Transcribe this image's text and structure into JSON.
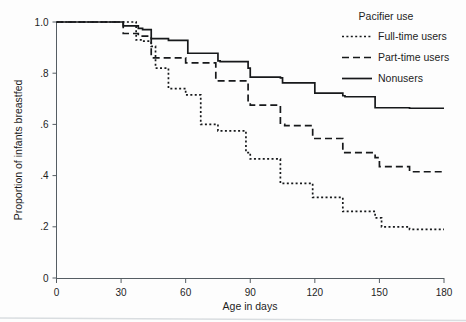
{
  "chart_data": {
    "type": "line",
    "subtype": "kaplan-meier-step",
    "title": "",
    "xlabel": "Age in days",
    "ylabel": "Proportion of infants breastfed",
    "xlim": [
      0,
      180
    ],
    "ylim": [
      0,
      1.0
    ],
    "xticks": [
      0,
      30,
      60,
      90,
      120,
      150,
      180
    ],
    "xtick_labels": [
      "0",
      "30",
      "60",
      "90",
      "120",
      "150",
      "180"
    ],
    "yticks": [
      0,
      0.2,
      0.4,
      0.6,
      0.8,
      1.0
    ],
    "ytick_labels": [
      "0",
      ".2",
      ".4",
      ".6",
      ".8",
      "1.0"
    ],
    "grid": false,
    "legend_position": "top-right",
    "legend_title": "Pacifier use",
    "series": [
      {
        "name": "Full-time users",
        "style": "dotted",
        "color": "#17191b",
        "x": [
          0,
          30,
          37,
          40,
          44,
          45,
          46,
          52,
          60,
          61,
          67,
          75,
          76,
          88,
          90,
          91,
          104,
          105,
          106,
          119,
          120,
          121,
          133,
          148,
          150,
          151,
          164,
          180
        ],
        "y": [
          1.0,
          1.0,
          0.93,
          0.925,
          0.905,
          0.905,
          0.82,
          0.74,
          0.715,
          0.715,
          0.6,
          0.575,
          0.575,
          0.49,
          0.465,
          0.465,
          0.37,
          0.37,
          0.37,
          0.315,
          0.315,
          0.315,
          0.26,
          0.235,
          0.235,
          0.2,
          0.19,
          0.19
        ]
      },
      {
        "name": "Part-time users",
        "style": "dashed",
        "color": "#17191b",
        "x": [
          0,
          30,
          31,
          38,
          40,
          44,
          45,
          60,
          61,
          74,
          75,
          76,
          89,
          90,
          91,
          104,
          105,
          106,
          119,
          120,
          121,
          133,
          148,
          150,
          164,
          180
        ],
        "y": [
          1.0,
          1.0,
          0.955,
          0.945,
          0.945,
          0.86,
          0.86,
          0.84,
          0.84,
          0.77,
          0.77,
          0.77,
          0.685,
          0.675,
          0.675,
          0.6,
          0.6,
          0.595,
          0.55,
          0.545,
          0.545,
          0.49,
          0.47,
          0.435,
          0.415,
          0.41
        ]
      },
      {
        "name": "Nonusers",
        "style": "solid",
        "color": "#17191b",
        "x": [
          0,
          30,
          31,
          38,
          40,
          44,
          45,
          52,
          60,
          61,
          74,
          75,
          76,
          89,
          90,
          91,
          104,
          105,
          106,
          119,
          120,
          121,
          133,
          134,
          148,
          150,
          164,
          180
        ],
        "y": [
          1.0,
          1.0,
          0.985,
          0.975,
          0.97,
          0.935,
          0.935,
          0.928,
          0.928,
          0.878,
          0.878,
          0.848,
          0.845,
          0.82,
          0.785,
          0.785,
          0.782,
          0.762,
          0.762,
          0.762,
          0.722,
          0.722,
          0.712,
          0.708,
          0.665,
          0.665,
          0.663,
          0.663
        ]
      }
    ]
  },
  "axes": {
    "x_title": "Age in days",
    "y_title": "Proportion of infants breastfed"
  },
  "legend": {
    "title": "Pacifier use",
    "entries": [
      {
        "label": "Full-time users",
        "style": "dotted"
      },
      {
        "label": "Part-time users",
        "style": "dashed"
      },
      {
        "label": "Nonusers",
        "style": "solid"
      }
    ]
  }
}
